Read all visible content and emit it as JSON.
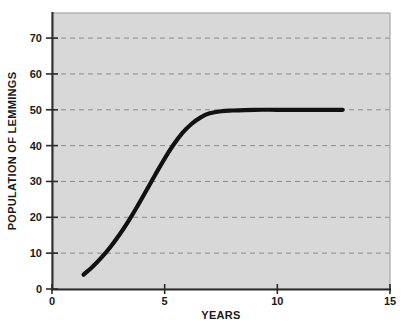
{
  "chart_data": {
    "type": "line",
    "title": "",
    "xlabel": "YEARS",
    "ylabel": "POPULATION OF LEMMINGS",
    "xlim": [
      0,
      15
    ],
    "ylim": [
      0,
      77
    ],
    "xticks": [
      0,
      5,
      10,
      15
    ],
    "yticks": [
      0,
      10,
      20,
      30,
      40,
      50,
      60,
      70
    ],
    "xtick_labels": [
      "0",
      "5",
      "10",
      "15"
    ],
    "ytick_labels": [
      "0",
      "10",
      "20",
      "30",
      "40",
      "50",
      "60",
      "70"
    ],
    "grid": "horizontal-dashed",
    "legend": "none",
    "carrying_capacity": 50,
    "series": [
      {
        "name": "Lemming population",
        "color": "#111111",
        "x": [
          1.4,
          1.8,
          2.2,
          2.6,
          3.0,
          3.4,
          3.8,
          4.2,
          4.6,
          5.0,
          5.4,
          5.8,
          6.2,
          6.6,
          7.0,
          7.5,
          8.0,
          9.0,
          10.0,
          11.0,
          12.0,
          12.9
        ],
        "y": [
          4.0,
          6.2,
          8.8,
          11.8,
          15.2,
          19.0,
          23.2,
          27.6,
          32.1,
          36.4,
          40.3,
          43.6,
          46.1,
          47.9,
          49.0,
          49.6,
          49.8,
          50.0,
          50.0,
          50.0,
          50.0,
          50.0
        ]
      }
    ]
  },
  "colors": {
    "plot_background": "#d8d8d8",
    "page_background": "#ffffff",
    "curve": "#111111",
    "gridline": "#8c8c8c",
    "axis": "#2b2b2b",
    "plot_border": "#a8a8a8"
  }
}
